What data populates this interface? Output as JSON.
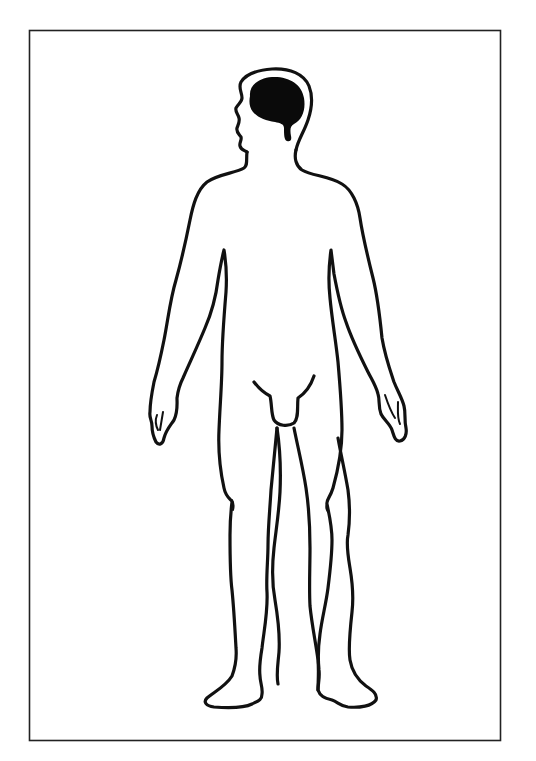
{
  "figure": {
    "description": "Outline of a standing human male body, front view with head in left-facing profile, brain highlighted in black",
    "highlighted_region": "brain",
    "colors": {
      "background": "#ffffff",
      "outline": "#111111",
      "highlight": "#0a0a0a",
      "frame": "#222222"
    }
  }
}
